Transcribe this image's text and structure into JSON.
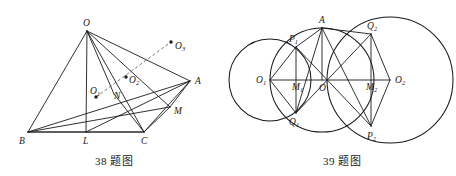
{
  "page": {
    "background": "#ffffff",
    "ink": "#1a1a1a",
    "width": 456,
    "height": 176
  },
  "figures": [
    {
      "id": "figure-38",
      "caption": "38 题图",
      "type": "solid-geometry-tetrahedron",
      "description": "Tetrahedron O-ABC with base points B, L, C on a line, apex O, point A to the right, point M on edge, N interior, and incenter-like points O1, O2, O3",
      "points": [
        {
          "name": "O",
          "label": "O",
          "sub": "",
          "x": 73,
          "y": 27,
          "label_dx": -4,
          "label_dy": -5,
          "dot": false
        },
        {
          "name": "B",
          "label": "B",
          "sub": "",
          "x": 14,
          "y": 128,
          "label_dx": -9,
          "label_dy": 12,
          "dot": false
        },
        {
          "name": "L",
          "label": "L",
          "sub": "",
          "x": 72,
          "y": 128,
          "label_dx": -3,
          "label_dy": 12,
          "dot": false
        },
        {
          "name": "C",
          "label": "C",
          "sub": "",
          "x": 130,
          "y": 128,
          "label_dx": -3,
          "label_dy": 12,
          "dot": false
        },
        {
          "name": "A",
          "label": "A",
          "sub": "",
          "x": 176,
          "y": 77,
          "label_dx": 5,
          "label_dy": 3,
          "dot": false
        },
        {
          "name": "M",
          "label": "M",
          "sub": "",
          "x": 156,
          "y": 103,
          "label_dx": 4,
          "label_dy": 7,
          "dot": false
        },
        {
          "name": "N",
          "label": "N",
          "sub": "",
          "x": 100,
          "y": 90,
          "label_dx": 0,
          "label_dy": 5,
          "dot": false
        },
        {
          "name": "O1",
          "label": "O",
          "sub": "1",
          "x": 82,
          "y": 93,
          "label_dx": -6,
          "label_dy": -3,
          "dot": true
        },
        {
          "name": "O2",
          "label": "O",
          "sub": "2",
          "x": 112,
          "y": 73,
          "label_dx": 3,
          "label_dy": 6,
          "dot": true
        },
        {
          "name": "O3",
          "label": "O",
          "sub": "3",
          "x": 157,
          "y": 38,
          "label_dx": 4,
          "label_dy": 7,
          "dot": true
        }
      ],
      "segments": [
        {
          "from": "O",
          "to": "B",
          "style": "solid"
        },
        {
          "from": "O",
          "to": "L",
          "style": "solid"
        },
        {
          "from": "O",
          "to": "C",
          "style": "solid"
        },
        {
          "from": "O",
          "to": "A",
          "style": "solid"
        },
        {
          "from": "O",
          "to": "M",
          "style": "solid"
        },
        {
          "from": "O",
          "to": "N",
          "style": "solid"
        },
        {
          "from": "B",
          "to": "L",
          "style": "solid"
        },
        {
          "from": "L",
          "to": "C",
          "style": "solid"
        },
        {
          "from": "B",
          "to": "C",
          "style": "solid"
        },
        {
          "from": "B",
          "to": "A",
          "style": "solid"
        },
        {
          "from": "B",
          "to": "M",
          "style": "solid"
        },
        {
          "from": "C",
          "to": "A",
          "style": "solid"
        },
        {
          "from": "A",
          "to": "L",
          "style": "solid"
        },
        {
          "from": "A",
          "to": "M",
          "style": "solid"
        },
        {
          "from": "C",
          "to": "M",
          "style": "solid"
        },
        {
          "from": "N",
          "to": "C",
          "style": "solid"
        }
      ],
      "dashed_segments": [
        {
          "from": "O1",
          "to": "O3",
          "style": "dashed"
        }
      ]
    },
    {
      "id": "figure-39",
      "caption": "39 题图",
      "type": "plane-geometry-three-circles",
      "description": "Three mutually intersecting circles centred on a common horizontal line, with labelled intersection points A, P1, Q1, Q2, P2 and axis points O1, M1, O, M2, O2",
      "circles": [
        {
          "name": "circle-O1",
          "cx": 30,
          "cy": 76,
          "r": 41
        },
        {
          "name": "circle-O",
          "cx": 82,
          "cy": 76,
          "r": 52
        },
        {
          "name": "circle-O2",
          "cx": 150,
          "cy": 76,
          "r": 63
        }
      ],
      "points": [
        {
          "name": "O1",
          "label": "O",
          "sub": "1",
          "x": 30,
          "y": 76,
          "label_dx": -14,
          "label_dy": 3,
          "dot": false
        },
        {
          "name": "O",
          "label": "O",
          "sub": "",
          "x": 82,
          "y": 76,
          "label_dx": -3,
          "label_dy": 11,
          "dot": false
        },
        {
          "name": "O2",
          "label": "O",
          "sub": "2",
          "x": 150,
          "y": 76,
          "label_dx": 5,
          "label_dy": 3,
          "dot": false
        },
        {
          "name": "M1",
          "label": "M",
          "sub": "1",
          "x": 56,
          "y": 76,
          "label_dx": -4,
          "label_dy": 10,
          "dot": false
        },
        {
          "name": "M2",
          "label": "M",
          "sub": "2",
          "x": 131,
          "y": 76,
          "label_dx": -5,
          "label_dy": 10,
          "dot": false
        },
        {
          "name": "A",
          "label": "A",
          "sub": "",
          "x": 82,
          "y": 24,
          "label_dx": -3,
          "label_dy": -5,
          "dot": false
        },
        {
          "name": "P1",
          "label": "P",
          "sub": "1",
          "x": 56,
          "y": 43,
          "label_dx": -7,
          "label_dy": -5,
          "dot": false
        },
        {
          "name": "Q1",
          "label": "Q",
          "sub": "1",
          "x": 56,
          "y": 109,
          "label_dx": -7,
          "label_dy": 12,
          "dot": false
        },
        {
          "name": "Q2",
          "label": "Q",
          "sub": "2",
          "x": 131,
          "y": 30,
          "label_dx": -4,
          "label_dy": -5,
          "dot": false
        },
        {
          "name": "P2",
          "label": "P",
          "sub": "2",
          "x": 131,
          "y": 122,
          "label_dx": -4,
          "label_dy": 13,
          "dot": false
        }
      ],
      "segments": [
        {
          "from": "O1",
          "to": "O2",
          "style": "solid"
        },
        {
          "from": "P1",
          "to": "Q1",
          "style": "solid"
        },
        {
          "from": "Q2",
          "to": "P2",
          "style": "solid"
        },
        {
          "from": "A",
          "to": "O",
          "style": "solid"
        },
        {
          "from": "A",
          "to": "P1",
          "style": "solid"
        },
        {
          "from": "A",
          "to": "Q1",
          "style": "solid"
        },
        {
          "from": "A",
          "to": "Q2",
          "style": "solid"
        },
        {
          "from": "A",
          "to": "P2",
          "style": "solid"
        },
        {
          "from": "O1",
          "to": "P1",
          "style": "solid"
        },
        {
          "from": "O1",
          "to": "Q1",
          "style": "solid"
        },
        {
          "from": "O2",
          "to": "Q2",
          "style": "solid"
        },
        {
          "from": "O2",
          "to": "P2",
          "style": "solid"
        },
        {
          "from": "P1",
          "to": "P2",
          "style": "solid"
        },
        {
          "from": "Q1",
          "to": "Q2",
          "style": "solid"
        }
      ]
    }
  ]
}
